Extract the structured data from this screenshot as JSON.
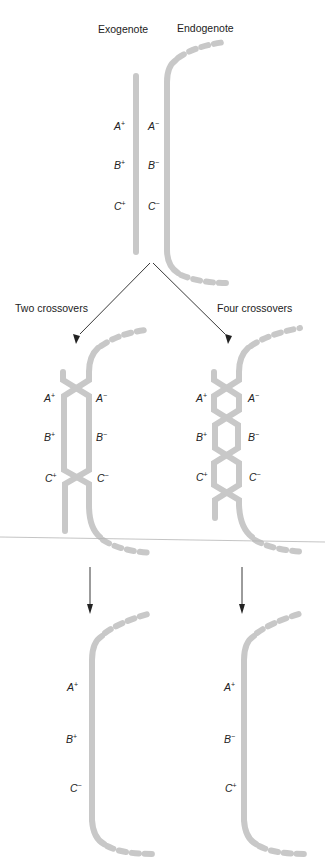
{
  "figure": {
    "top": {
      "exogenote_label": "Exogenote",
      "endogenote_label": "Endogenote",
      "exogenote_alleles": [
        {
          "gene": "A",
          "sign": "+"
        },
        {
          "gene": "B",
          "sign": "+"
        },
        {
          "gene": "C",
          "sign": "+"
        }
      ],
      "endogenote_alleles": [
        {
          "gene": "A",
          "sign": "−"
        },
        {
          "gene": "B",
          "sign": "−"
        },
        {
          "gene": "C",
          "sign": "−"
        }
      ]
    },
    "branches": [
      {
        "label": "Two crossovers",
        "crossover_count": 2,
        "left_alleles": [
          {
            "gene": "A",
            "sign": "+"
          },
          {
            "gene": "B",
            "sign": "+"
          },
          {
            "gene": "C",
            "sign": "+"
          }
        ],
        "right_alleles": [
          {
            "gene": "A",
            "sign": "−"
          },
          {
            "gene": "B",
            "sign": "−"
          },
          {
            "gene": "C",
            "sign": "−"
          }
        ],
        "result_alleles": [
          {
            "gene": "A",
            "sign": "+"
          },
          {
            "gene": "B",
            "sign": "+"
          },
          {
            "gene": "C",
            "sign": "−"
          }
        ]
      },
      {
        "label": "Four crossovers",
        "crossover_count": 4,
        "left_alleles": [
          {
            "gene": "A",
            "sign": "+"
          },
          {
            "gene": "B",
            "sign": "+"
          },
          {
            "gene": "C",
            "sign": "+"
          }
        ],
        "right_alleles": [
          {
            "gene": "A",
            "sign": "−"
          },
          {
            "gene": "B",
            "sign": "−"
          },
          {
            "gene": "C",
            "sign": "−"
          }
        ],
        "result_alleles": [
          {
            "gene": "A",
            "sign": "+"
          },
          {
            "gene": "B",
            "sign": "−"
          },
          {
            "gene": "C",
            "sign": "+"
          }
        ]
      }
    ],
    "colors": {
      "chromosome": "#c8c8c8",
      "text": "#222222",
      "arrow": "#222222",
      "separator": "#b5b5b5"
    }
  }
}
